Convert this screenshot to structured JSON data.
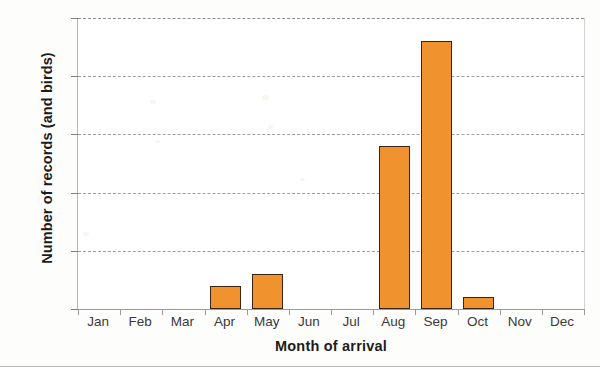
{
  "chart_data": {
    "type": "bar",
    "title": "",
    "xlabel": "Month of arrival",
    "ylabel": "Number of records (and birds)",
    "categories": [
      "Jan",
      "Feb",
      "Mar",
      "Apr",
      "May",
      "Jun",
      "Jul",
      "Aug",
      "Sep",
      "Oct",
      "Nov",
      "Dec"
    ],
    "values": [
      0,
      0,
      0,
      2,
      3,
      0,
      0,
      14,
      23,
      1,
      0,
      0
    ],
    "ylim": [
      0,
      25
    ],
    "yticks": [
      0,
      5,
      10,
      15,
      20,
      25
    ],
    "ytick_labels": [
      "0",
      "5",
      "10",
      "15",
      "20",
      "25"
    ],
    "grid": "horizontal-dashed",
    "legend": "none",
    "bar_fill_color": "#f0922e",
    "bar_edge_color": "#3b2415",
    "gridline_color": "#9d9d9d",
    "axis_color": "#9a9a9a",
    "tick_label_color": "#3a3a3a",
    "axis_title_color": "#1c1c1c"
  }
}
